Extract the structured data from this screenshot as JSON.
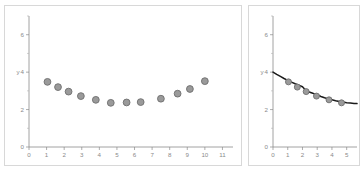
{
  "figure": {
    "background_color": "#ffffff",
    "panel_border_color": "#d8d8d8",
    "axis_color": "#8a8a8a",
    "marker_fill": "#9a9a9a",
    "marker_stroke": "#6e6e6e",
    "curve_color": "#1a1a1a"
  },
  "chart_data": [
    {
      "id": "left-scatter",
      "type": "scatter",
      "title": "",
      "subtitle": "",
      "xlabel": "",
      "ylabel": "y",
      "xlim": [
        0,
        11.6
      ],
      "ylim": [
        0,
        7.0
      ],
      "grid": false,
      "legend": null,
      "x_ticks": [
        0,
        1,
        2,
        3,
        4,
        5,
        6,
        7,
        8,
        9,
        10,
        11
      ],
      "x_tick_labels": [
        "0",
        "1",
        "2",
        "3",
        "4",
        "5",
        "6",
        "7",
        "8",
        "9",
        "10",
        "11"
      ],
      "y_ticks": [
        0,
        2,
        4,
        6
      ],
      "y_tick_labels": [
        "0",
        "2",
        "4",
        "6"
      ],
      "y_minor_ticks": [
        1,
        3,
        5,
        7
      ],
      "marker": "circle",
      "x": [
        1.05,
        1.65,
        2.25,
        2.95,
        3.8,
        4.65,
        5.55,
        6.35,
        7.5,
        8.45,
        9.15,
        10.0
      ],
      "y": [
        3.48,
        3.2,
        2.96,
        2.72,
        2.52,
        2.36,
        2.38,
        2.4,
        2.58,
        2.85,
        3.1,
        3.52
      ]
    },
    {
      "id": "right-scatter-fit",
      "type": "scatter",
      "title": "",
      "subtitle": "",
      "xlabel": "",
      "ylabel": "y",
      "xlim": [
        0,
        5.7
      ],
      "ylim": [
        0,
        7.0
      ],
      "grid": false,
      "legend": null,
      "x_ticks": [
        0,
        1,
        2,
        3,
        4,
        5
      ],
      "x_tick_labels": [
        "0",
        "1",
        "2",
        "3",
        "4",
        "5"
      ],
      "y_ticks": [
        0,
        2,
        4,
        6
      ],
      "y_tick_labels": [
        "0",
        "2",
        "4",
        "6"
      ],
      "y_minor_ticks": [
        1,
        3,
        5,
        7
      ],
      "marker": "circle",
      "x": [
        1.05,
        1.65,
        2.25,
        2.95,
        3.8,
        4.65
      ],
      "y": [
        3.48,
        3.2,
        2.96,
        2.72,
        2.52,
        2.36
      ],
      "series": [
        {
          "name": "fitted-curve",
          "type": "line",
          "x": [
            0.0,
            0.25,
            0.5,
            0.75,
            1.0,
            1.25,
            1.5,
            1.75,
            2.0,
            2.25,
            2.5,
            2.75,
            3.0,
            3.25,
            3.5,
            3.75,
            4.0,
            4.25,
            4.5,
            4.75,
            5.0,
            5.25,
            5.5,
            5.7
          ],
          "y": [
            4.0,
            3.88,
            3.77,
            3.66,
            3.56,
            3.47,
            3.38,
            3.3,
            3.22,
            3.0,
            2.93,
            2.86,
            2.8,
            2.7,
            2.63,
            2.57,
            2.52,
            2.47,
            2.43,
            2.4,
            2.37,
            2.35,
            2.33,
            2.32
          ]
        }
      ]
    }
  ]
}
